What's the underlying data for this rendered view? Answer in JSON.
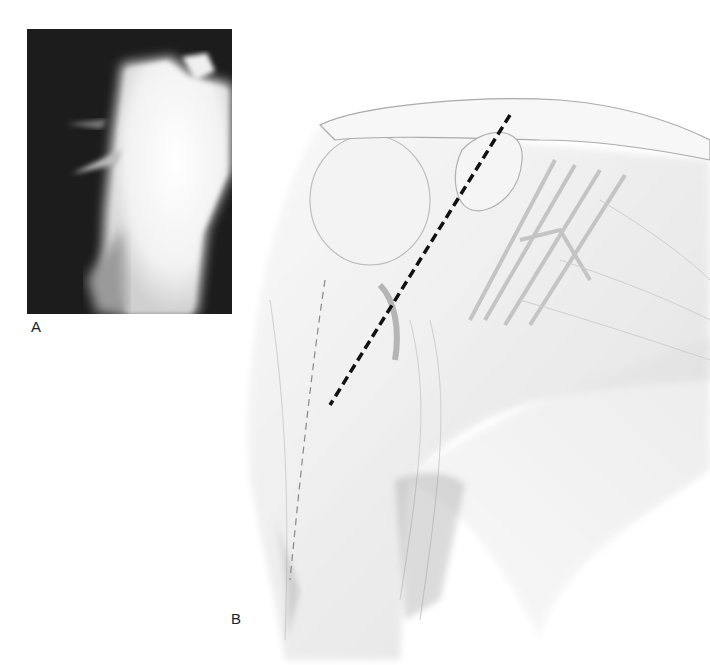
{
  "figure": {
    "panels": [
      {
        "id": "A",
        "label": "A",
        "type": "radiograph",
        "description": "Shoulder X-ray showing proximal humerus"
      },
      {
        "id": "B",
        "label": "B",
        "type": "anatomical-illustration",
        "description": "Anterior shoulder anatomy with dashed incision line"
      }
    ],
    "colors": {
      "xray_background": "#1c1c1c",
      "bone": "#f4f4f4",
      "illustration_line": "#8a8a8a",
      "incision_line": "#111111",
      "background": "#ffffff"
    }
  }
}
